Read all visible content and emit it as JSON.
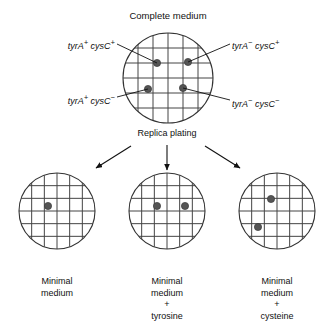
{
  "figure": {
    "title": "Complete medium",
    "process_label": "Replica plating",
    "colony_color": "#555555",
    "plate_outline_color": "#333333",
    "grid_color": "#444444",
    "background": "#ffffff"
  },
  "master_plate": {
    "name": "complete-medium-plate",
    "label": "Complete medium",
    "center": {
      "x": 168,
      "y": 78
    },
    "radius": 45,
    "grid": {
      "vertical_lines": 5,
      "horizontal_lines": 5
    },
    "colonies": [
      {
        "id": "colony-tyrA-plus-cysC-plus",
        "x": 157,
        "y": 63,
        "genotype_label": "tyrA+ cysC+"
      },
      {
        "id": "colony-tyrA-minus-cysC-plus",
        "x": 188,
        "y": 62,
        "genotype_label": "tyrA- cysC+"
      },
      {
        "id": "colony-tyrA-plus-cysC-minus",
        "x": 148,
        "y": 89,
        "genotype_label": "tyrA+ cysC-"
      },
      {
        "id": "colony-tyrA-minus-cysC-minus",
        "x": 183,
        "y": 88,
        "genotype_label": "tyrA- cysC-"
      }
    ],
    "genotype_labels": [
      {
        "id": "label-tyrA-plus-cysC-plus",
        "gene1": "tyrA",
        "sign1": "+",
        "gene2": "cysC",
        "sign2": "+",
        "text_x": 115,
        "text_y": 41,
        "align": "right",
        "leader": {
          "x1": 117,
          "y1": 44,
          "x2": 157,
          "y2": 63
        }
      },
      {
        "id": "label-tyrA-minus-cysC-plus",
        "gene1": "tyrA",
        "sign1": "−",
        "gene2": "cysC",
        "sign2": "+",
        "text_x": 232,
        "text_y": 41,
        "align": "left",
        "leader": {
          "x1": 230,
          "y1": 44,
          "x2": 188,
          "y2": 62
        }
      },
      {
        "id": "label-tyrA-plus-cysC-minus",
        "gene1": "tyrA",
        "sign1": "+",
        "gene2": "cysC",
        "sign2": "−",
        "text_x": 115,
        "text_y": 96,
        "align": "right",
        "leader": {
          "x1": 117,
          "y1": 97,
          "x2": 148,
          "y2": 89
        }
      },
      {
        "id": "label-tyrA-minus-cysC-minus",
        "gene1": "tyrA",
        "sign1": "−",
        "gene2": "cysC",
        "sign2": "−",
        "text_x": 232,
        "text_y": 99,
        "align": "left",
        "leader": {
          "x1": 230,
          "y1": 100,
          "x2": 183,
          "y2": 88
        }
      }
    ]
  },
  "replica_step": {
    "label": "Replica plating",
    "label_x": 167,
    "label_y": 133,
    "arrows": [
      {
        "id": "arrow-left",
        "x1": 131,
        "y1": 146,
        "x2": 96,
        "y2": 168
      },
      {
        "id": "arrow-center",
        "x1": 167,
        "y1": 145,
        "x2": 167,
        "y2": 170
      },
      {
        "id": "arrow-right",
        "x1": 205,
        "y1": 146,
        "x2": 240,
        "y2": 168
      }
    ]
  },
  "replica_plates": [
    {
      "id": "minimal-medium-plate",
      "caption_lines": [
        "Minimal",
        "medium"
      ],
      "caption_x": 57,
      "caption_y": 276,
      "center": {
        "x": 57,
        "y": 211
      },
      "radius": 38,
      "grid": {
        "vertical_lines": 5,
        "horizontal_lines": 5
      },
      "colonies": [
        {
          "id": "colony-1",
          "x": 48,
          "y": 206
        }
      ]
    },
    {
      "id": "minimal-medium-tyrosine-plate",
      "caption_lines": [
        "Minimal",
        "medium",
        "+",
        "tyrosine"
      ],
      "caption_x": 167,
      "caption_y": 276,
      "center": {
        "x": 167,
        "y": 211
      },
      "radius": 38,
      "grid": {
        "vertical_lines": 5,
        "horizontal_lines": 5
      },
      "colonies": [
        {
          "id": "colony-1",
          "x": 157,
          "y": 206
        },
        {
          "id": "colony-2",
          "x": 185,
          "y": 206
        }
      ]
    },
    {
      "id": "minimal-medium-cysteine-plate",
      "caption_lines": [
        "Minimal",
        "medium",
        "+",
        "cysteine"
      ],
      "caption_x": 277,
      "caption_y": 276,
      "center": {
        "x": 277,
        "y": 211
      },
      "radius": 38,
      "grid": {
        "vertical_lines": 5,
        "horizontal_lines": 5
      },
      "colonies": [
        {
          "id": "colony-1",
          "x": 271,
          "y": 199
        },
        {
          "id": "colony-2",
          "x": 258,
          "y": 227
        }
      ]
    }
  ]
}
